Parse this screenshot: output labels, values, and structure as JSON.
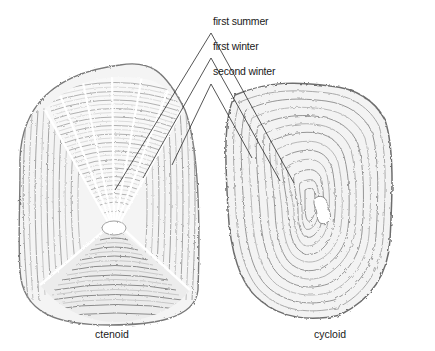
{
  "diagram": {
    "annotations": [
      {
        "label": "first summer",
        "x": 211,
        "y": 18,
        "apex": [
          211,
          35
        ]
      },
      {
        "label": "first winter",
        "x": 211,
        "y": 43,
        "apex": [
          211,
          60
        ]
      },
      {
        "label": "second winter",
        "x": 211,
        "y": 68,
        "apex": [
          211,
          86
        ]
      }
    ],
    "scales": [
      {
        "name": "ctenoid",
        "caption": "ctenoid",
        "caption_x": 100,
        "caption_y": 325
      },
      {
        "name": "cycloid",
        "caption": "cycloid",
        "caption_x": 314,
        "caption_y": 325
      }
    ],
    "colors": {
      "ink": "#1a1a1a",
      "ring_dark": "#6e6e6e",
      "ring_mid": "#a8a8a8",
      "ring_light": "#d9d9d9",
      "background": "#ffffff"
    }
  }
}
